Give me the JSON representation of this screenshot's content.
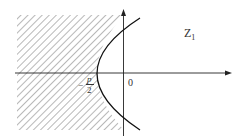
{
  "diagram": {
    "region_label": "Z",
    "region_label_sub": "1",
    "origin_label": "0",
    "vertex_label": {
      "sign": "−",
      "numerator": "p",
      "denominator": "2"
    },
    "colors": {
      "line": "#222222",
      "hatch": "#777777",
      "background": "#ffffff"
    }
  }
}
